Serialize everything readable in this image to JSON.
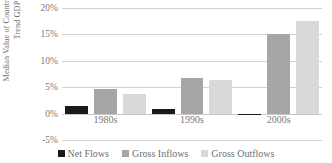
{
  "chart_data": {
    "type": "bar",
    "title": "",
    "xlabel": "",
    "ylabel": "Median Value of Country Averages / Trend GDP",
    "categories": [
      "1980s",
      "1990s",
      "2000s"
    ],
    "series": [
      {
        "name": "Net Flows",
        "color": "#1a1a1a",
        "values": [
          1.5,
          0.8,
          -0.3
        ]
      },
      {
        "name": "Gross Inflows",
        "color": "#a6a6a6",
        "values": [
          4.7,
          6.8,
          15.0
        ]
      },
      {
        "name": "Gross Outflows",
        "color": "#d9d9d9",
        "values": [
          3.7,
          6.3,
          17.5
        ]
      }
    ],
    "ylim": [
      -5,
      20
    ],
    "ytick_labels": [
      "20%",
      "15%",
      "10%",
      "5%",
      "0%",
      "-5%"
    ],
    "ytick_values": [
      20,
      15,
      10,
      5,
      0,
      -5
    ],
    "grid": true,
    "legend_position": "bottom"
  },
  "legend": {
    "items": [
      {
        "label": "Net Flows"
      },
      {
        "label": "Gross Inflows"
      },
      {
        "label": "Gross Outflows"
      }
    ]
  }
}
